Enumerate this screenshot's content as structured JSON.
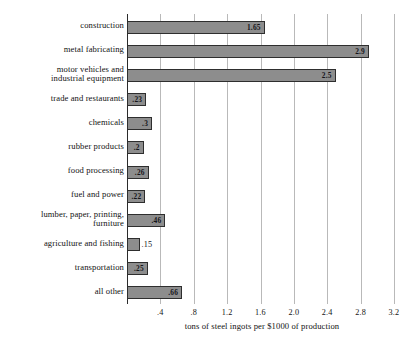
{
  "chart_data": {
    "type": "bar",
    "orientation": "horizontal",
    "title": "",
    "xlabel": "tons of steel ingots per $1000 of production",
    "ylabel": "",
    "xlim": [
      0,
      3.2
    ],
    "xticks": [
      ".4",
      ".8",
      "1.2",
      "1.6",
      "2.0",
      "2.4",
      "2.8",
      "3.2"
    ],
    "xtick_values": [
      0.4,
      0.8,
      1.2,
      1.6,
      2.0,
      2.4,
      2.8,
      3.2
    ],
    "grid": true,
    "legend": "none",
    "categories": [
      "construction",
      "metal fabricating",
      "motor vehicles and\nindustrial equipment",
      "trade and restaurants",
      "chemicals",
      "rubber products",
      "food processing",
      "fuel and power",
      "lumber, paper, printing,\nfurniture",
      "agriculture and fishing",
      "transportation",
      "all other"
    ],
    "values": [
      1.65,
      2.9,
      2.5,
      0.23,
      0.3,
      0.2,
      0.26,
      0.22,
      0.46,
      0.15,
      0.25,
      0.66
    ],
    "value_labels": [
      "1.65",
      "2.9",
      "2.5",
      ".23",
      ".3",
      ".2",
      ".26",
      ".22",
      ".46",
      ".15",
      ".25",
      ".66"
    ],
    "label_placement": [
      "inside",
      "inside",
      "inside",
      "inside",
      "inside",
      "inside",
      "inside",
      "inside",
      "inside",
      "outside",
      "inside",
      "inside"
    ],
    "bar_color": "#8d8d8d",
    "bar_edge_color": "#2e2e2e",
    "grid_color": "#b9b9b9",
    "axis_color": "#2b2b2b"
  }
}
